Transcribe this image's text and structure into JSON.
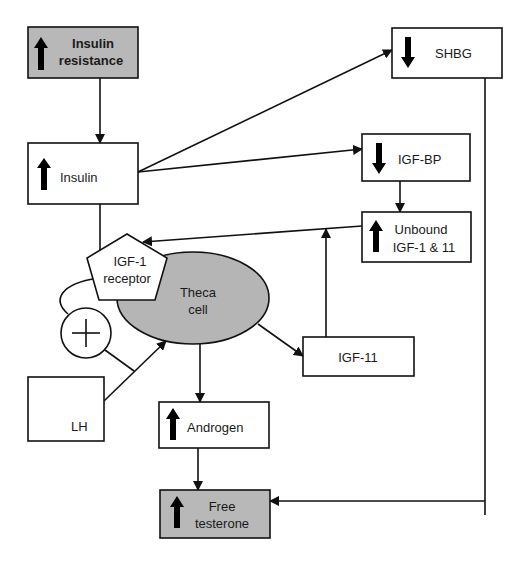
{
  "diagram": {
    "type": "flowchart",
    "colors": {
      "line": "#111111",
      "box_fill": "#ffffff",
      "highlight_fill": "#b8b8b8",
      "ellipse_fill": "#b5b5b5",
      "text": "#1a1a1a"
    },
    "nodes": {
      "insulin_resistance": {
        "line1": "Insulin",
        "line2": "resistance",
        "indicator": "up-arrow"
      },
      "insulin": {
        "label": "Insulin",
        "indicator": "up-arrow"
      },
      "shbg": {
        "label": "SHBG",
        "indicator": "down-arrow"
      },
      "igf_bp": {
        "label": "IGF-BP",
        "indicator": "down-arrow"
      },
      "unbound": {
        "line1": "Unbound",
        "line2": "IGF-1 & 11",
        "indicator": "up-arrow"
      },
      "igf1_receptor": {
        "line1": "IGF-1",
        "line2": "receptor"
      },
      "theca_cell": {
        "line1": "Theca",
        "line2": "cell"
      },
      "plus": {
        "symbol": "+"
      },
      "lh": {
        "label": "LH"
      },
      "igf11": {
        "label": "IGF-11"
      },
      "androgen": {
        "label": "Androgen",
        "indicator": "up-arrow"
      },
      "free_testerone": {
        "line1": "Free",
        "line2": "testerone",
        "indicator": "up-arrow"
      }
    },
    "edges": [
      {
        "from": "Insulin resistance",
        "to": "Insulin"
      },
      {
        "from": "Insulin",
        "to": "SHBG"
      },
      {
        "from": "Insulin",
        "to": "IGF-BP"
      },
      {
        "from": "Insulin",
        "to": "IGF-1 receptor"
      },
      {
        "from": "IGF-BP",
        "to": "Unbound IGF-1 & 11"
      },
      {
        "from": "Unbound IGF-1 & 11",
        "to": "IGF-1 receptor"
      },
      {
        "from": "IGF-11",
        "to": "Unbound-to-receptor line"
      },
      {
        "from": "Theca cell",
        "to": "IGF-11"
      },
      {
        "from": "Theca cell",
        "to": "Androgen"
      },
      {
        "from": "LH",
        "to": "Theca cell"
      },
      {
        "from": "IGF-1 receptor",
        "to": "Plus (synergy)"
      },
      {
        "from": "Plus (synergy)",
        "to": "LH-to-theca line"
      },
      {
        "from": "Androgen",
        "to": "Free testerone"
      },
      {
        "from": "SHBG",
        "to": "Free testerone"
      }
    ]
  }
}
